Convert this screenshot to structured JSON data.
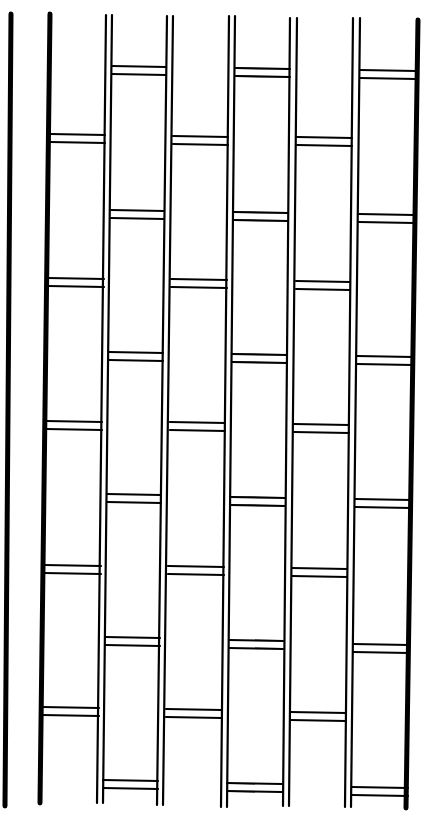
{
  "figure": {
    "title": "",
    "stroke_color": "#000000",
    "background_color": "#ffffff",
    "thick_rails": [
      {
        "x1": 11,
        "y1": 14,
        "x2": 5,
        "y2": 806,
        "w": 5
      },
      {
        "x1": 50,
        "y1": 14,
        "x2": 40,
        "y2": 803,
        "w": 5
      },
      {
        "x1": 418,
        "y1": 20,
        "x2": 406,
        "y2": 808,
        "w": 5
      }
    ],
    "thin_lines": [
      {
        "x1": 106,
        "y1": 15,
        "x2": 97,
        "y2": 803
      },
      {
        "x1": 112,
        "y1": 15,
        "x2": 103,
        "y2": 803
      },
      {
        "x1": 167,
        "y1": 16,
        "x2": 157,
        "y2": 805
      },
      {
        "x1": 173,
        "y1": 16,
        "x2": 163,
        "y2": 805
      },
      {
        "x1": 229,
        "y1": 16,
        "x2": 221,
        "y2": 807
      },
      {
        "x1": 235,
        "y1": 16,
        "x2": 227,
        "y2": 807
      },
      {
        "x1": 290,
        "y1": 18,
        "x2": 283,
        "y2": 806
      },
      {
        "x1": 297,
        "y1": 18,
        "x2": 289,
        "y2": 806
      },
      {
        "x1": 353,
        "y1": 18,
        "x2": 345,
        "y2": 807
      },
      {
        "x1": 360,
        "y1": 18,
        "x2": 351,
        "y2": 807
      }
    ],
    "rung_gap": 8,
    "rungs": [
      {
        "x1": 50,
        "x2": 105,
        "y": 134
      },
      {
        "x1": 48,
        "x2": 104,
        "y": 278
      },
      {
        "x1": 46,
        "x2": 102,
        "y": 421
      },
      {
        "x1": 44,
        "x2": 101,
        "y": 565
      },
      {
        "x1": 42,
        "x2": 99,
        "y": 707
      },
      {
        "x1": 112,
        "x2": 166,
        "y": 66
      },
      {
        "x1": 111,
        "x2": 164,
        "y": 210
      },
      {
        "x1": 109,
        "x2": 163,
        "y": 352
      },
      {
        "x1": 107,
        "x2": 161,
        "y": 494
      },
      {
        "x1": 105,
        "x2": 160,
        "y": 637
      },
      {
        "x1": 103,
        "x2": 158,
        "y": 780
      },
      {
        "x1": 173,
        "x2": 228,
        "y": 136
      },
      {
        "x1": 171,
        "x2": 227,
        "y": 279
      },
      {
        "x1": 170,
        "x2": 225,
        "y": 422
      },
      {
        "x1": 168,
        "x2": 224,
        "y": 566
      },
      {
        "x1": 166,
        "x2": 222,
        "y": 709
      },
      {
        "x1": 236,
        "x2": 290,
        "y": 68
      },
      {
        "x1": 234,
        "x2": 288,
        "y": 212
      },
      {
        "x1": 232,
        "x2": 287,
        "y": 354
      },
      {
        "x1": 230,
        "x2": 285,
        "y": 497
      },
      {
        "x1": 229,
        "x2": 283,
        "y": 640
      },
      {
        "x1": 227,
        "x2": 282,
        "y": 783
      },
      {
        "x1": 297,
        "x2": 352,
        "y": 137
      },
      {
        "x1": 296,
        "x2": 350,
        "y": 281
      },
      {
        "x1": 294,
        "x2": 349,
        "y": 424
      },
      {
        "x1": 292,
        "x2": 347,
        "y": 568
      },
      {
        "x1": 290,
        "x2": 346,
        "y": 712
      },
      {
        "x1": 360,
        "x2": 416,
        "y": 70
      },
      {
        "x1": 359,
        "x2": 414,
        "y": 214
      },
      {
        "x1": 357,
        "x2": 413,
        "y": 356
      },
      {
        "x1": 355,
        "x2": 411,
        "y": 499
      },
      {
        "x1": 353,
        "x2": 409,
        "y": 644
      },
      {
        "x1": 352,
        "x2": 408,
        "y": 787
      }
    ]
  }
}
